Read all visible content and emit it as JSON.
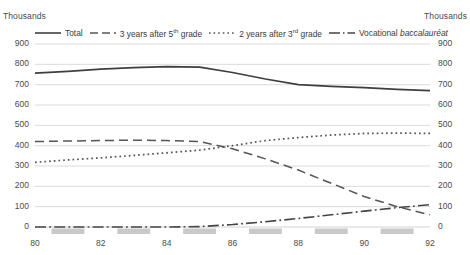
{
  "units": {
    "left": "Thousands",
    "right": "Thousands"
  },
  "legend": [
    {
      "label": "Total",
      "style": "solid",
      "color": "#3f3f3f"
    },
    {
      "label": "3 years after 5",
      "sup": "th",
      "label_tail": " grade",
      "style": "dashed",
      "color": "#555555"
    },
    {
      "label": "2 years after 3",
      "sup": "rd",
      "label_tail": " grade",
      "style": "dotted",
      "color": "#555555"
    },
    {
      "label": "Vocational ",
      "italic_part": "baccalauréat",
      "style": "dashdot",
      "color": "#444444"
    }
  ],
  "axes": {
    "y_ticks": [
      "900",
      "800",
      "700",
      "600",
      "500",
      "400",
      "300",
      "200",
      "100",
      "0"
    ],
    "y_ticks_right": [
      "900",
      "800",
      "700",
      "600",
      "500",
      "400",
      "300",
      "200",
      "100",
      "0"
    ],
    "x_ticks": [
      "80",
      "82",
      "84",
      "86",
      "88",
      "90",
      "92"
    ]
  },
  "chart_data": {
    "type": "line",
    "title": "",
    "xlabel": "",
    "ylabel": "Thousands",
    "ylim": [
      0,
      900
    ],
    "xlim": [
      80,
      92
    ],
    "grid": true,
    "legend_position": "top",
    "x": [
      80,
      81,
      82,
      83,
      84,
      85,
      86,
      87,
      88,
      89,
      90,
      91,
      92
    ],
    "series": [
      {
        "name": "Total",
        "style": "solid",
        "values": [
          757,
          765,
          776,
          784,
          789,
          786,
          760,
          728,
          700,
          692,
          685,
          677,
          671
        ]
      },
      {
        "name": "3 years after 5th grade",
        "style": "dashed",
        "values": [
          420,
          423,
          425,
          427,
          425,
          420,
          385,
          335,
          280,
          215,
          150,
          100,
          60
        ]
      },
      {
        "name": "2 years after 3rd grade",
        "style": "dotted",
        "values": [
          318,
          330,
          340,
          352,
          365,
          378,
          400,
          425,
          440,
          452,
          460,
          462,
          460
        ]
      },
      {
        "name": "Vocational baccalauréat",
        "style": "dashdot",
        "values": [
          0,
          0,
          0,
          0,
          0,
          2,
          12,
          26,
          42,
          60,
          78,
          95,
          110
        ]
      }
    ]
  },
  "axis_bands": {
    "count": 6,
    "color": "#c9c9c9"
  }
}
